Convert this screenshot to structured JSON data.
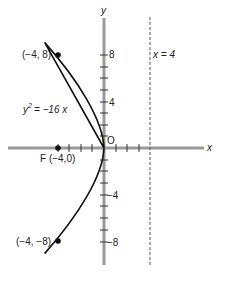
{
  "diagram": {
    "type": "parabola",
    "equation": {
      "lhs": "y",
      "exp": "2",
      "rhs": "= −16 x"
    },
    "axes": {
      "x_label": "x",
      "y_label": "y",
      "origin_label": "O"
    },
    "y_ticks": [
      {
        "value": 8,
        "label": "8"
      },
      {
        "value": 4,
        "label": "4"
      },
      {
        "value": -4,
        "label": "−4"
      },
      {
        "value": -8,
        "label": "−8"
      }
    ],
    "directrix": {
      "label": "x = 4",
      "x": 4
    },
    "focus": {
      "label": "F (−4,0)",
      "x": -4,
      "y": 0
    },
    "points": [
      {
        "label": "(−4, 8)",
        "x": -4,
        "y": 8
      },
      {
        "label": "(−4, −8)",
        "x": -4,
        "y": -8
      }
    ],
    "colors": {
      "axis": "#9a9a9a",
      "curve": "#111111",
      "dashed": "#555555"
    }
  }
}
